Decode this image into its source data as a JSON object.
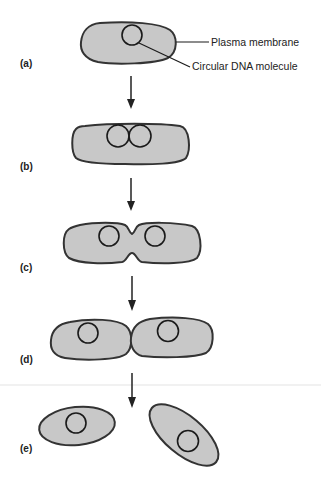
{
  "figure": {
    "annotations": {
      "plasma_membrane": "Plasma membrane",
      "circular_dna": "Circular DNA molecule"
    },
    "stages": [
      {
        "id": "a",
        "label": "(a)"
      },
      {
        "id": "b",
        "label": "(b)"
      },
      {
        "id": "c",
        "label": "(c)"
      },
      {
        "id": "d",
        "label": "(d)"
      },
      {
        "id": "e",
        "label": "(e)"
      }
    ],
    "colors": {
      "cytoplasm_fill": "#c8c8c8",
      "membrane_stroke": "#333333",
      "dna_stroke": "#1a1a1a",
      "arrow": "#222222",
      "background": "#ffffff"
    }
  }
}
